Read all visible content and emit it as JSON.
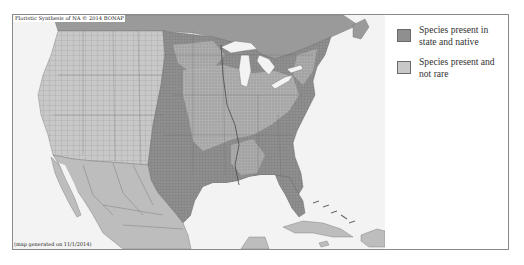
{
  "map": {
    "credit": "Floristic Synthesis of NA © 2014  BONAP",
    "generated": "(map generated on 11/1/2014)",
    "colors": {
      "ocean": "#f3f3f3",
      "native": "#8f8f8f",
      "present": "#c8c8c8",
      "canada": "#9a9a9a",
      "mexico_caribbean": "#bdbdbd",
      "lakes": "#f3f3f3",
      "borders": "#6e6e6e"
    }
  },
  "legend": {
    "items": [
      {
        "label": "Species present in state and native",
        "color": "#8f8f8f"
      },
      {
        "label": "Species present and not rare",
        "color": "#c8c8c8"
      }
    ]
  }
}
